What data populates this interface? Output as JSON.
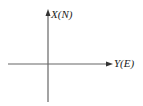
{
  "diagram": {
    "type": "coordinate-axes",
    "vertical_axis": {
      "label": "X(N)"
    },
    "horizontal_axis": {
      "label": "Y(E)"
    },
    "line_color": "#555555"
  }
}
